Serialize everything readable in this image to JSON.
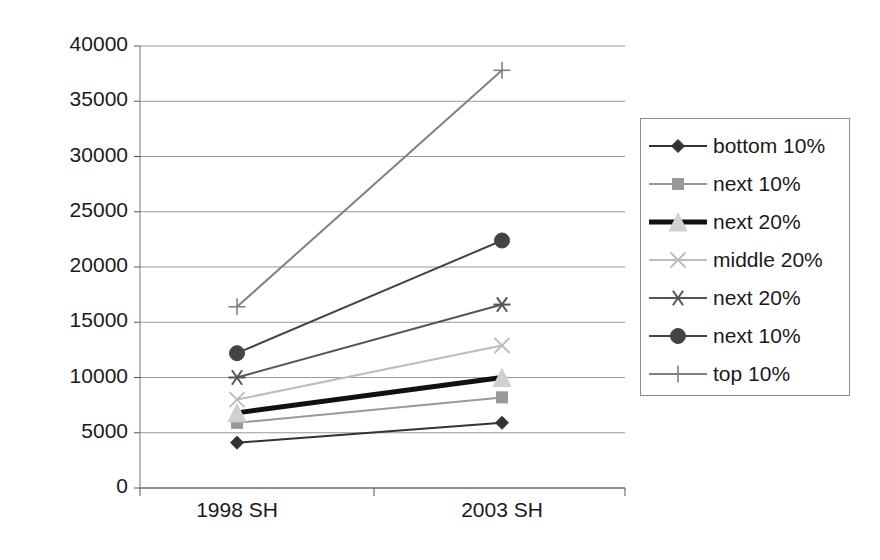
{
  "chart_data": {
    "type": "line",
    "title": "",
    "xlabel": "",
    "ylabel": "",
    "categories": [
      "1998 SH",
      "2003 SH"
    ],
    "ylim": [
      0,
      40000
    ],
    "yticks": [
      "0",
      "5000",
      "10000",
      "15000",
      "20000",
      "25000",
      "30000",
      "35000",
      "40000"
    ],
    "ytick_values": [
      0,
      5000,
      10000,
      15000,
      20000,
      25000,
      30000,
      35000,
      40000
    ],
    "grid": true,
    "legend_position": "right",
    "series": [
      {
        "name": "bottom 10%",
        "marker": "diamond",
        "color": "#333333",
        "width": 2,
        "values": [
          4100,
          5900
        ]
      },
      {
        "name": "next 10%",
        "marker": "square",
        "color": "#999999",
        "width": 2,
        "values": [
          5900,
          8200
        ]
      },
      {
        "name": "next 20%",
        "marker": "triangle",
        "color": "#111111",
        "width": 5,
        "values": [
          6800,
          10000
        ]
      },
      {
        "name": "middle 20%",
        "marker": "cross-x",
        "color": "#bdbdbd",
        "width": 2,
        "values": [
          8000,
          12900
        ]
      },
      {
        "name": "next 20%",
        "marker": "asterisk",
        "color": "#555555",
        "width": 2,
        "values": [
          10000,
          16600
        ]
      },
      {
        "name": "next 10%",
        "marker": "circle",
        "color": "#444444",
        "width": 2,
        "values": [
          12200,
          22400
        ]
      },
      {
        "name": "top 10%",
        "marker": "plus",
        "color": "#808080",
        "width": 2,
        "values": [
          16400,
          37800
        ]
      }
    ]
  },
  "legend": {
    "items": [
      {
        "label": "bottom 10%"
      },
      {
        "label": "next 10%"
      },
      {
        "label": "next 20%"
      },
      {
        "label": "middle 20%"
      },
      {
        "label": "next 20%"
      },
      {
        "label": "next 10%"
      },
      {
        "label": "top 10%"
      }
    ]
  },
  "axes": {
    "y_labels": [
      "40000",
      "35000",
      "30000",
      "25000",
      "20000",
      "15000",
      "10000",
      "5000",
      "0"
    ],
    "x_labels": [
      "1998 SH",
      "2003 SH"
    ]
  }
}
